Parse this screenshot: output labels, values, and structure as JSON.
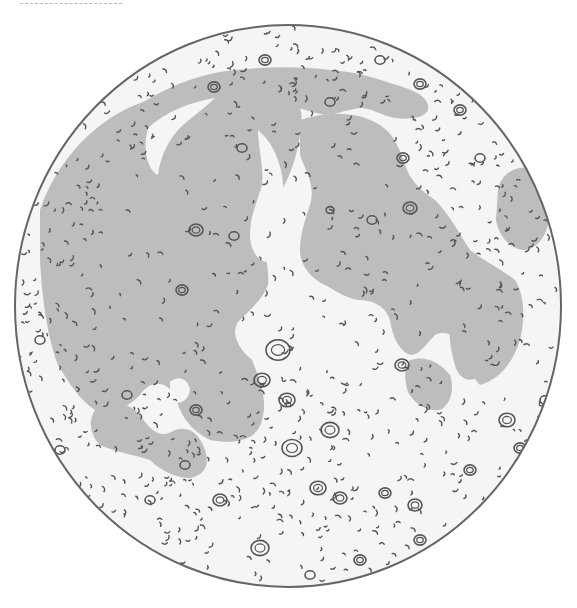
{
  "figure": {
    "colors": {
      "background": "#ffffff",
      "highlands": "#f5f5f5",
      "maria": "#bdbdbd",
      "linework": "#555555",
      "rim": "#666666",
      "dash": "#b8b8b8"
    },
    "disk": {
      "cx": 288,
      "cy": 306,
      "rx": 273,
      "ry": 281
    },
    "maria": [
      {
        "name": "oceanus-procellarum-imbrium",
        "d": "M40,210 C60,150 110,110 150,100 C190,80 230,75 270,80 C300,90 305,110 300,135 C296,160 290,175 282,190 C270,200 262,215 262,230 C262,250 270,265 268,285 C262,300 250,310 238,322 C230,335 240,350 252,360 C260,380 268,400 262,420 C258,440 235,445 210,440 C190,430 180,415 175,395 C165,380 150,380 140,395 C125,410 110,415 95,410 C80,400 70,385 58,365 C48,340 42,300 40,260 Z"
      },
      {
        "name": "mare-frigoris",
        "d": "M118,120 C150,95 180,80 220,72 C260,66 300,66 330,70 C360,72 380,80 400,86 C420,92 430,100 428,110 C424,118 410,120 395,118 C380,115 372,108 360,108 C345,110 335,115 325,115 C300,110 280,100 250,100 C220,102 200,108 180,118 C160,128 140,140 125,150 Z"
      },
      {
        "name": "mare-serenitatis-tranquillitatis",
        "d": "M300,120 C330,110 360,112 380,125 C395,135 400,150 405,165 C410,180 420,190 435,200 C450,215 460,235 470,250 C485,262 500,268 515,280 C525,295 525,320 520,340 C512,365 498,380 480,385 C470,375 465,360 462,345 C455,335 445,330 435,335 C425,345 420,355 410,355 C398,350 392,335 390,320 C385,305 372,300 358,300 C345,298 335,290 325,285 C310,278 300,265 300,250 C300,235 305,220 310,205 C316,185 305,170 300,155 Z"
      },
      {
        "name": "mare-crisium",
        "d": "M498,190 C500,175 515,165 530,168 C545,172 550,190 550,210 C550,230 540,248 525,250 C510,250 498,235 496,220 Z"
      },
      {
        "name": "mare-nubium-humorum",
        "d": "M95,410 C110,400 130,402 140,415 C150,430 160,440 175,430 C190,425 200,435 205,450 C210,465 205,475 190,478 C175,478 160,470 150,460 C135,455 115,452 100,445 C90,435 88,420 95,410 Z"
      },
      {
        "name": "mare-nectaris",
        "d": "M410,360 C425,355 440,362 450,375 C455,390 450,405 440,410 C428,412 415,405 408,392 C404,380 404,368 410,360 Z"
      },
      {
        "name": "mare-fecunditatis",
        "d": "M455,300 C470,295 485,305 490,320 C495,340 490,360 480,375 C470,385 458,378 455,365 C450,348 448,330 450,315 Z"
      }
    ],
    "highland_islands": [
      {
        "name": "apennine-ridge-light",
        "d": "M258,130 C270,140 278,155 282,175 C286,200 280,215 272,228 C264,238 262,250 268,262 C258,262 250,250 250,235 C250,215 258,200 262,185 C264,165 258,148 258,130 Z"
      },
      {
        "name": "sinus-iridum-rim",
        "d": "M148,128 C165,112 190,102 215,98 C205,108 190,118 178,130 C165,145 160,160 158,175 C148,170 142,150 148,128 Z"
      },
      {
        "name": "kepler-copernicus-patch",
        "d": "M170,382 C178,375 188,378 190,390 C188,402 178,406 170,400 Z"
      }
    ],
    "craters": [
      {
        "x": 265,
        "y": 60,
        "r": 6
      },
      {
        "x": 214,
        "y": 87,
        "r": 6
      },
      {
        "x": 420,
        "y": 84,
        "r": 6
      },
      {
        "x": 330,
        "y": 102,
        "r": 5
      },
      {
        "x": 403,
        "y": 158,
        "r": 6
      },
      {
        "x": 410,
        "y": 208,
        "r": 7
      },
      {
        "x": 242,
        "y": 148,
        "r": 5
      },
      {
        "x": 196,
        "y": 230,
        "r": 7
      },
      {
        "x": 234,
        "y": 236,
        "r": 5
      },
      {
        "x": 182,
        "y": 290,
        "r": 6
      },
      {
        "x": 278,
        "y": 350,
        "r": 12
      },
      {
        "x": 262,
        "y": 380,
        "r": 8
      },
      {
        "x": 287,
        "y": 400,
        "r": 8
      },
      {
        "x": 196,
        "y": 410,
        "r": 6
      },
      {
        "x": 330,
        "y": 430,
        "r": 9
      },
      {
        "x": 292,
        "y": 448,
        "r": 10
      },
      {
        "x": 318,
        "y": 488,
        "r": 8
      },
      {
        "x": 340,
        "y": 498,
        "r": 7
      },
      {
        "x": 385,
        "y": 493,
        "r": 6
      },
      {
        "x": 415,
        "y": 505,
        "r": 7
      },
      {
        "x": 260,
        "y": 548,
        "r": 9
      },
      {
        "x": 507,
        "y": 420,
        "r": 8
      },
      {
        "x": 520,
        "y": 448,
        "r": 6
      },
      {
        "x": 127,
        "y": 395,
        "r": 5
      },
      {
        "x": 185,
        "y": 465,
        "r": 5
      },
      {
        "x": 402,
        "y": 365,
        "r": 7
      },
      {
        "x": 545,
        "y": 400,
        "r": 5
      },
      {
        "x": 480,
        "y": 158,
        "r": 5
      },
      {
        "x": 372,
        "y": 220,
        "r": 5
      },
      {
        "x": 330,
        "y": 210,
        "r": 4
      },
      {
        "x": 460,
        "y": 110,
        "r": 6
      },
      {
        "x": 380,
        "y": 60,
        "r": 5
      },
      {
        "x": 420,
        "y": 540,
        "r": 6
      },
      {
        "x": 220,
        "y": 500,
        "r": 7
      },
      {
        "x": 150,
        "y": 500,
        "r": 5
      },
      {
        "x": 92,
        "y": 520,
        "r": 5
      },
      {
        "x": 60,
        "y": 450,
        "r": 5
      },
      {
        "x": 40,
        "y": 340,
        "r": 5
      },
      {
        "x": 470,
        "y": 470,
        "r": 6
      },
      {
        "x": 500,
        "y": 510,
        "r": 5
      },
      {
        "x": 360,
        "y": 560,
        "r": 6
      },
      {
        "x": 310,
        "y": 575,
        "r": 5
      }
    ],
    "specks_seed": 17,
    "specks_count": 900
  }
}
